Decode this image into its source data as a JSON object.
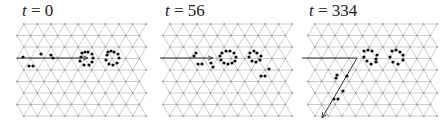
{
  "figure": {
    "lattice": {
      "type": "triangular",
      "rows": 9,
      "cols": 10,
      "dx": 13.6,
      "dy": 11.5,
      "line_color": "#b8b8b8",
      "node_color": "#9a9a9a"
    },
    "panels": [
      {
        "id": "t0",
        "title_var": "t",
        "title_eq": " = ",
        "title_val": "0",
        "x0": 17,
        "title_x": 22,
        "arrow": {
          "points": [
            [
              17,
              58
            ],
            [
              88,
              58
            ]
          ],
          "head": true
        },
        "dots": [
          [
            23,
            57
          ],
          [
            41,
            54
          ],
          [
            51,
            55
          ],
          [
            53,
            58
          ],
          [
            29,
            66
          ],
          [
            33,
            66
          ],
          [
            82,
            53
          ],
          [
            85,
            52
          ],
          [
            88,
            52
          ],
          [
            92,
            54
          ],
          [
            93,
            58
          ],
          [
            92,
            62
          ],
          [
            89,
            65
          ],
          [
            84,
            65
          ],
          [
            80,
            61
          ],
          [
            81,
            57
          ],
          [
            108,
            52
          ],
          [
            111,
            51
          ],
          [
            114,
            52
          ],
          [
            118,
            54
          ],
          [
            119,
            58
          ],
          [
            117,
            63
          ],
          [
            113,
            65
          ],
          [
            109,
            64
          ],
          [
            106,
            60
          ],
          [
            107,
            55
          ]
        ]
      },
      {
        "id": "t56",
        "title_var": "t",
        "title_eq": " = ",
        "title_val": "56",
        "x0": 163,
        "title_x": 165,
        "arrow": {
          "points": [
            [
              160,
              58
            ],
            [
              213,
              58
            ]
          ],
          "head": true
        },
        "dots": [
          [
            194,
            56
          ],
          [
            196,
            53
          ],
          [
            198,
            64
          ],
          [
            202,
            64
          ],
          [
            211,
            63
          ],
          [
            213,
            67
          ],
          [
            222,
            53
          ],
          [
            226,
            51
          ],
          [
            230,
            51
          ],
          [
            234,
            53
          ],
          [
            236,
            57
          ],
          [
            235,
            61
          ],
          [
            232,
            63
          ],
          [
            228,
            64
          ],
          [
            224,
            63
          ],
          [
            221,
            60
          ],
          [
            220,
            56
          ],
          [
            250,
            53
          ],
          [
            254,
            51
          ],
          [
            257,
            53
          ],
          [
            249,
            57
          ],
          [
            252,
            61
          ],
          [
            256,
            62
          ],
          [
            260,
            60
          ],
          [
            261,
            56
          ],
          [
            269,
            69
          ],
          [
            261,
            76
          ],
          [
            265,
            76
          ]
        ]
      },
      {
        "id": "t334",
        "title_var": "t",
        "title_eq": " = ",
        "title_val": "334",
        "x0": 308,
        "title_x": 309,
        "arrow": {
          "points": [
            [
              302,
              58
            ],
            [
              357,
              58
            ],
            [
              322,
              118
            ]
          ],
          "head": true
        },
        "dots": [
          [
            364,
            51
          ],
          [
            368,
            50
          ],
          [
            372,
            51
          ],
          [
            364,
            57
          ],
          [
            367,
            61
          ],
          [
            371,
            64
          ],
          [
            376,
            59
          ],
          [
            376,
            62
          ],
          [
            377,
            55
          ],
          [
            392,
            51
          ],
          [
            396,
            50
          ],
          [
            400,
            52
          ],
          [
            390,
            57
          ],
          [
            393,
            62
          ],
          [
            398,
            64
          ],
          [
            403,
            60
          ],
          [
            403,
            55
          ],
          [
            336,
            78
          ],
          [
            337,
            75
          ],
          [
            347,
            76
          ],
          [
            343,
            91
          ],
          [
            334,
            99
          ],
          [
            338,
            99
          ]
        ]
      }
    ]
  }
}
